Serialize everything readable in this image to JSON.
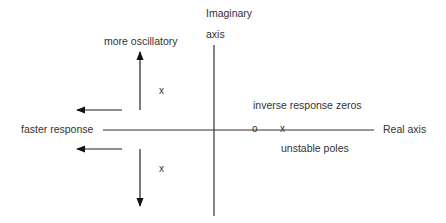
{
  "diagram": {
    "axes": {
      "imaginary_label_line1": "Imaginary",
      "imaginary_label_line2": "axis",
      "real_label": "Real axis"
    },
    "annotations": {
      "more_oscillatory": "more  oscillatory",
      "faster_response": "faster  response",
      "inverse_response_zeros": "inverse  response  zeros",
      "unstable_poles": "unstable   poles"
    },
    "markers": {
      "pole_upper": "x",
      "pole_lower": "x",
      "zero_rhp": "o",
      "pole_rhp": "x"
    },
    "colors": {
      "line": "#222222",
      "text": "#333333",
      "background": "#ffffff"
    }
  }
}
